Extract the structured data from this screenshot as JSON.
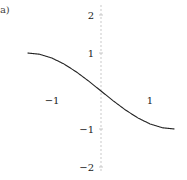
{
  "panel_label": "(a)",
  "chart_data": {
    "type": "line",
    "title": "",
    "xlabel": "",
    "ylabel": "",
    "xlim": [
      -1.5,
      1.5
    ],
    "ylim": [
      -2.2,
      2.3
    ],
    "grid": false,
    "x_ticks": [
      -1,
      1
    ],
    "x_tick_labels": [
      "−1",
      "1"
    ],
    "y_ticks": [
      2,
      1,
      -1,
      -2
    ],
    "y_tick_labels": [
      "2",
      "1",
      "−1",
      "−2"
    ],
    "series": [
      {
        "name": "curve",
        "color": "#222222",
        "x": [
          -1.5,
          -1.25,
          -1.0,
          -0.75,
          -0.5,
          -0.25,
          0.0,
          0.25,
          0.5,
          0.75,
          1.0,
          1.25,
          1.5
        ],
        "y": [
          1.0,
          0.966,
          0.866,
          0.707,
          0.5,
          0.259,
          0.0,
          -0.259,
          -0.5,
          -0.707,
          -0.866,
          -0.966,
          -1.0
        ]
      }
    ],
    "axis_color": "#bbbbbb",
    "layout": {
      "origin_px": [
        101,
        91
      ],
      "x_unit_px": 49,
      "y_unit_px": 38,
      "y_axis_top_px": 5,
      "y_axis_bottom_px": 172
    }
  }
}
